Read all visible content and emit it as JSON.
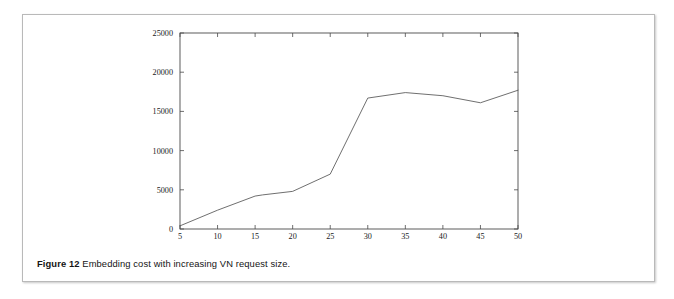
{
  "figure": {
    "caption_label": "Figure 12",
    "caption_text": "Embedding cost with increasing VN request size."
  },
  "chart_data": {
    "type": "line",
    "title": "",
    "xlabel": "Nodes per VN Request",
    "ylabel": "",
    "xlim": [
      5,
      50
    ],
    "ylim": [
      0,
      25000
    ],
    "xticks": [
      5,
      10,
      15,
      20,
      25,
      30,
      35,
      40,
      45,
      50
    ],
    "xtick_labels": [
      "5",
      "10",
      "15",
      "20",
      "25",
      "30",
      "35",
      "40",
      "45",
      "50"
    ],
    "yticks": [
      0,
      5000,
      10000,
      15000,
      20000,
      25000
    ],
    "ytick_labels": [
      "0",
      "5000",
      "10000",
      "15000",
      "20000",
      "25000"
    ],
    "grid": false,
    "legend": null,
    "line_color": "#555555",
    "x": [
      5,
      10,
      15,
      16,
      20,
      25,
      30,
      35,
      40,
      45,
      50
    ],
    "values": [
      400,
      2400,
      4200,
      4350,
      4800,
      7000,
      16700,
      17400,
      17000,
      16100,
      17700
    ],
    "series": [
      {
        "name": "Embedding cost",
        "x": [
          5,
          10,
          15,
          16,
          20,
          25,
          30,
          35,
          40,
          45,
          50
        ],
        "values": [
          400,
          2400,
          4200,
          4350,
          4800,
          7000,
          16700,
          17400,
          17000,
          16100,
          17700
        ]
      }
    ]
  }
}
